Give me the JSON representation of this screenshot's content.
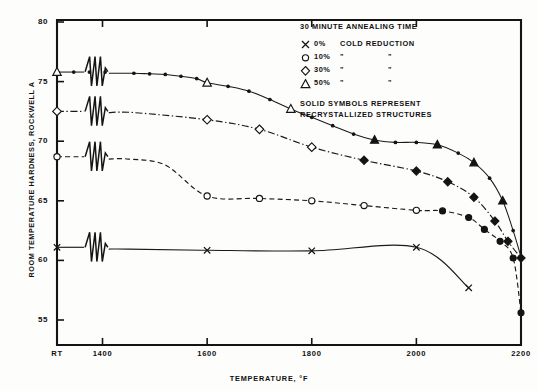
{
  "chart_data": {
    "type": "line",
    "title": "",
    "xlabel": "TEMPERATURE, °F",
    "ylabel": "ROOM TEMPERATURE HARDNESS, ROCKWELL A",
    "xlim": [
      1300,
      2200
    ],
    "ylim": [
      53,
      80
    ],
    "grid": false,
    "axis_break": {
      "present": true,
      "between": [
        "RT",
        "1400"
      ],
      "note": "zigzag break symbol on each curve"
    },
    "xticks": [
      {
        "value": 1313,
        "label": "RT"
      },
      {
        "value": 1400,
        "label": "1400"
      },
      {
        "value": 1600,
        "label": "1600"
      },
      {
        "value": 1800,
        "label": "1800"
      },
      {
        "value": 2000,
        "label": "2000"
      },
      {
        "value": 2200,
        "label": "2200"
      }
    ],
    "yticks": [
      {
        "value": 55,
        "label": "55"
      },
      {
        "value": 60,
        "label": "60"
      },
      {
        "value": 65,
        "label": "65"
      },
      {
        "value": 70,
        "label": "70"
      },
      {
        "value": 75,
        "label": "75"
      },
      {
        "value": 80,
        "label": "80"
      }
    ],
    "legend": {
      "position": "top-right",
      "title": "30 MINUTE ANNEALING TIME",
      "entries": [
        {
          "symbol": "x",
          "label_main": "0%",
          "label_rest": "COLD REDUCTION",
          "ditto1": "",
          "ditto2": ""
        },
        {
          "symbol": "circle",
          "label_main": "10%",
          "label_rest": "",
          "ditto1": "\"",
          "ditto2": "\""
        },
        {
          "symbol": "diamond",
          "label_main": "30%",
          "label_rest": "",
          "ditto1": "\"",
          "ditto2": "\""
        },
        {
          "symbol": "triangle",
          "label_main": "50%",
          "label_rest": "",
          "ditto1": "\"",
          "ditto2": "\""
        }
      ],
      "footnote_line1": "SOLID SYMBOLS REPRESENT",
      "footnote_line2": "RECRYSTALLIZED STRUCTURES"
    },
    "series": [
      {
        "name": "0% COLD REDUCTION",
        "symbol": "x",
        "linestyle": "solid",
        "color": "#1a1a1a",
        "points": [
          {
            "x": 1313,
            "y": 61.1,
            "filled": false,
            "marker": "x"
          },
          {
            "x": 1390,
            "y": 61.0,
            "filled": false,
            "marker": "none"
          },
          {
            "x": 1450,
            "y": 60.95,
            "filled": false,
            "marker": "none"
          },
          {
            "x": 1600,
            "y": 60.85,
            "filled": false,
            "marker": "x"
          },
          {
            "x": 1800,
            "y": 60.8,
            "filled": false,
            "marker": "x"
          },
          {
            "x": 2000,
            "y": 61.1,
            "filled": false,
            "marker": "x"
          },
          {
            "x": 2100,
            "y": 57.7,
            "filled": false,
            "marker": "x"
          }
        ]
      },
      {
        "name": "10% COLD REDUCTION",
        "symbol": "circle",
        "linestyle": "dashed",
        "color": "#1a1a1a",
        "points": [
          {
            "x": 1313,
            "y": 68.7,
            "filled": false,
            "marker": "circle"
          },
          {
            "x": 1360,
            "y": 68.65,
            "filled": false,
            "marker": "none"
          },
          {
            "x": 1450,
            "y": 68.5,
            "filled": false,
            "marker": "none"
          },
          {
            "x": 1520,
            "y": 68.0,
            "filled": false,
            "marker": "none"
          },
          {
            "x": 1600,
            "y": 65.4,
            "filled": false,
            "marker": "circle"
          },
          {
            "x": 1700,
            "y": 65.2,
            "filled": false,
            "marker": "circle"
          },
          {
            "x": 1800,
            "y": 65.0,
            "filled": false,
            "marker": "circle"
          },
          {
            "x": 1900,
            "y": 64.6,
            "filled": false,
            "marker": "circle"
          },
          {
            "x": 2000,
            "y": 64.2,
            "filled": false,
            "marker": "circle"
          },
          {
            "x": 2050,
            "y": 64.15,
            "filled": true,
            "marker": "circle"
          },
          {
            "x": 2100,
            "y": 63.6,
            "filled": true,
            "marker": "circle"
          },
          {
            "x": 2130,
            "y": 62.6,
            "filled": true,
            "marker": "circle"
          },
          {
            "x": 2160,
            "y": 61.6,
            "filled": true,
            "marker": "circle"
          },
          {
            "x": 2185,
            "y": 60.2,
            "filled": true,
            "marker": "circle"
          },
          {
            "x": 2200,
            "y": 55.6,
            "filled": true,
            "marker": "circle"
          }
        ]
      },
      {
        "name": "30% COLD REDUCTION",
        "symbol": "diamond",
        "linestyle": "dashdot",
        "color": "#1a1a1a",
        "points": [
          {
            "x": 1313,
            "y": 72.5,
            "filled": false,
            "marker": "diamond"
          },
          {
            "x": 1380,
            "y": 72.45,
            "filled": false,
            "marker": "none"
          },
          {
            "x": 1460,
            "y": 72.4,
            "filled": false,
            "marker": "none"
          },
          {
            "x": 1600,
            "y": 71.8,
            "filled": false,
            "marker": "diamond"
          },
          {
            "x": 1700,
            "y": 71.0,
            "filled": false,
            "marker": "diamond"
          },
          {
            "x": 1800,
            "y": 69.5,
            "filled": false,
            "marker": "diamond"
          },
          {
            "x": 1900,
            "y": 68.4,
            "filled": true,
            "marker": "diamond"
          },
          {
            "x": 2000,
            "y": 67.5,
            "filled": true,
            "marker": "diamond"
          },
          {
            "x": 2060,
            "y": 66.6,
            "filled": true,
            "marker": "diamond"
          },
          {
            "x": 2110,
            "y": 65.3,
            "filled": true,
            "marker": "diamond"
          },
          {
            "x": 2150,
            "y": 63.3,
            "filled": true,
            "marker": "diamond"
          },
          {
            "x": 2175,
            "y": 61.6,
            "filled": true,
            "marker": "diamond"
          },
          {
            "x": 2200,
            "y": 60.2,
            "filled": true,
            "marker": "diamond"
          }
        ]
      },
      {
        "name": "50% COLD REDUCTION",
        "symbol": "triangle",
        "linestyle": "solid-dotted",
        "color": "#1a1a1a",
        "points": [
          {
            "x": 1313,
            "y": 75.8,
            "filled": false,
            "marker": "triangle"
          },
          {
            "x": 1345,
            "y": 75.8,
            "filled": true,
            "marker": "dot"
          },
          {
            "x": 1375,
            "y": 75.8,
            "filled": true,
            "marker": "dot"
          },
          {
            "x": 1405,
            "y": 75.8,
            "filled": true,
            "marker": "dot"
          },
          {
            "x": 1460,
            "y": 75.7,
            "filled": true,
            "marker": "dot"
          },
          {
            "x": 1490,
            "y": 75.65,
            "filled": true,
            "marker": "dot"
          },
          {
            "x": 1520,
            "y": 75.6,
            "filled": true,
            "marker": "dot"
          },
          {
            "x": 1550,
            "y": 75.45,
            "filled": true,
            "marker": "dot"
          },
          {
            "x": 1580,
            "y": 75.25,
            "filled": true,
            "marker": "dot"
          },
          {
            "x": 1600,
            "y": 74.9,
            "filled": false,
            "marker": "triangle"
          },
          {
            "x": 1640,
            "y": 74.6,
            "filled": true,
            "marker": "dot"
          },
          {
            "x": 1680,
            "y": 74.2,
            "filled": true,
            "marker": "dot"
          },
          {
            "x": 1720,
            "y": 73.5,
            "filled": true,
            "marker": "dot"
          },
          {
            "x": 1760,
            "y": 72.7,
            "filled": false,
            "marker": "triangle"
          },
          {
            "x": 1800,
            "y": 72.0,
            "filled": true,
            "marker": "dot"
          },
          {
            "x": 1840,
            "y": 71.3,
            "filled": true,
            "marker": "dot"
          },
          {
            "x": 1880,
            "y": 70.6,
            "filled": true,
            "marker": "dot"
          },
          {
            "x": 1920,
            "y": 70.1,
            "filled": true,
            "marker": "triangle"
          },
          {
            "x": 1960,
            "y": 69.9,
            "filled": true,
            "marker": "dot"
          },
          {
            "x": 2000,
            "y": 69.9,
            "filled": true,
            "marker": "dot"
          },
          {
            "x": 2040,
            "y": 69.7,
            "filled": true,
            "marker": "triangle"
          },
          {
            "x": 2080,
            "y": 69.0,
            "filled": true,
            "marker": "dot"
          },
          {
            "x": 2110,
            "y": 68.2,
            "filled": true,
            "marker": "triangle"
          },
          {
            "x": 2140,
            "y": 66.9,
            "filled": true,
            "marker": "dot"
          },
          {
            "x": 2165,
            "y": 65.0,
            "filled": true,
            "marker": "triangle"
          },
          {
            "x": 2185,
            "y": 62.5,
            "filled": true,
            "marker": "dot"
          },
          {
            "x": 2200,
            "y": 60.3,
            "filled": true,
            "marker": "dot"
          }
        ]
      }
    ]
  }
}
